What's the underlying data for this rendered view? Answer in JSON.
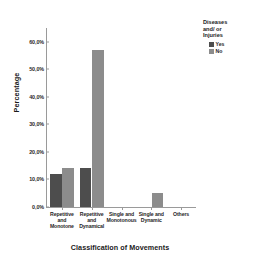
{
  "chart_data": {
    "type": "bar",
    "title": "",
    "xlabel": "Classification of Movements",
    "ylabel": "Percentage",
    "categories": [
      "Repetitive and Monotone",
      "Repetitive and Dynamical",
      "Single and Monotonous",
      "Single and Dynamic",
      "Others"
    ],
    "category_lines": [
      [
        "Repetitive",
        "and",
        "Monotone"
      ],
      [
        "Repetitive",
        "and",
        "Dynamical"
      ],
      [
        "Single and",
        "Monotonous"
      ],
      [
        "Single and",
        "Dynamic"
      ],
      [
        "Others"
      ]
    ],
    "series": [
      {
        "name": "Yes",
        "color": "#4d4d4d",
        "values": [
          12.0,
          14.0,
          0.0,
          0.0,
          0.0
        ]
      },
      {
        "name": "No",
        "color": "#8c8c8c",
        "values": [
          14.0,
          57.0,
          0.0,
          5.0,
          0.0
        ]
      }
    ],
    "ylim": [
      0,
      65
    ],
    "yticks": [
      0,
      10,
      20,
      30,
      40,
      50,
      60
    ],
    "ytick_labels": [
      "0,0%",
      "10,0%",
      "20,0%",
      "30,0%",
      "40,0%",
      "50,0%",
      "60,0%"
    ],
    "grid": false,
    "legend_position": "top-right"
  },
  "legend": {
    "title": "Diseases and/ or Injuries",
    "title_lines": [
      "Diseases",
      "and/ or",
      "Injuries"
    ],
    "items": [
      {
        "label": "Yes",
        "color": "#4d4d4d"
      },
      {
        "label": "No",
        "color": "#8c8c8c"
      }
    ]
  },
  "axis": {
    "y_title": "Percentage",
    "x_title": "Classification of Movements"
  }
}
